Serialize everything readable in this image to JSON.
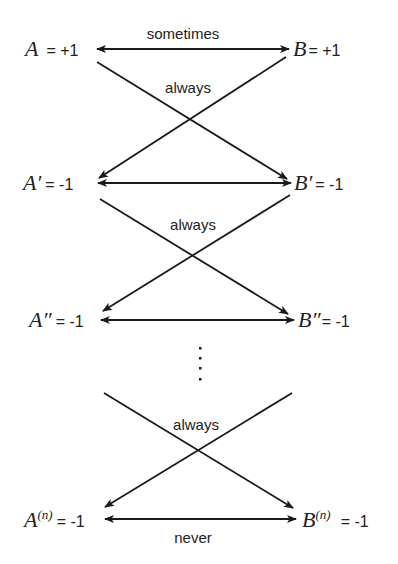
{
  "diagram": {
    "type": "correlation-chain",
    "rows": [
      {
        "a_var": "A",
        "a_mark": "",
        "a_value": "= +1",
        "b_var": "B",
        "b_mark": "",
        "b_value": "= +1",
        "link_label": "sometimes"
      },
      {
        "a_var": "A",
        "a_mark": "′",
        "a_value": "= -1",
        "b_var": "B",
        "b_mark": "′",
        "b_value": "= -1",
        "link_label": ""
      },
      {
        "a_var": "A",
        "a_mark": "″",
        "a_value": "= -1",
        "b_var": "B",
        "b_mark": "″",
        "b_value": "= -1",
        "link_label": ""
      },
      {
        "a_var": "A",
        "a_mark": "(n)",
        "a_value": "= -1",
        "b_var": "B",
        "b_mark": "(n)",
        "b_value": "= -1",
        "link_label": "never"
      }
    ],
    "cross_labels": [
      "always",
      "always",
      "always"
    ],
    "ellipsis": "⋮",
    "colors": {
      "ink": "#1a1a1a",
      "background": "#ffffff"
    }
  }
}
